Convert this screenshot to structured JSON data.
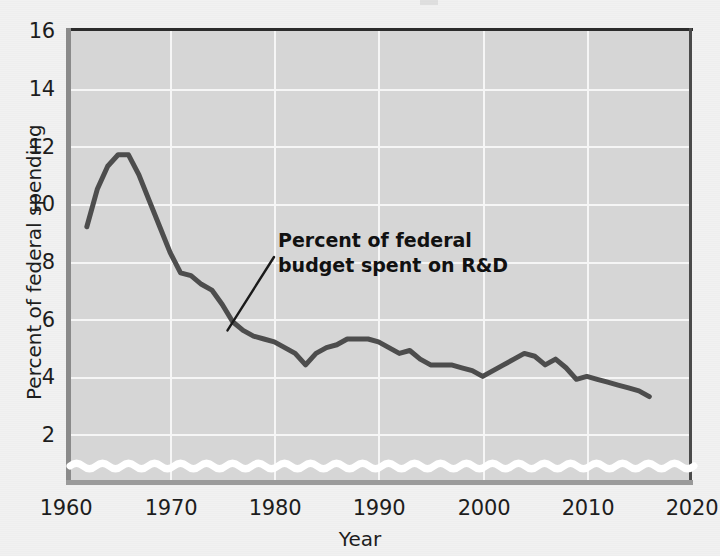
{
  "chart_data": {
    "type": "line",
    "title": "",
    "xlabel": "Year",
    "ylabel": "Percent of federal spending",
    "xlim": [
      1960,
      2020
    ],
    "ylim": [
      1.2,
      16
    ],
    "yticks": [
      2,
      4,
      6,
      8,
      10,
      12,
      14,
      16
    ],
    "xticks": [
      1960,
      1970,
      1980,
      1990,
      2000,
      2010,
      2020
    ],
    "grid": true,
    "legend": "none",
    "axis_break": true,
    "axis_break_note": "white wavy line near bottom indicating broken y-axis",
    "line_color": "#4d4d4d",
    "plot_background": "#d6d6d6",
    "page_background": "#f1f1f1",
    "gridline_color": "#f6f6f6",
    "annotations": [
      {
        "text_line1": "Percent of federal",
        "text_line2": "budget spent on R&D",
        "points_to_x": 1975.5,
        "points_to_y": 5.6
      }
    ],
    "series": [
      {
        "name": "Percent of federal budget spent on R&D",
        "x": [
          1962,
          1963,
          1964,
          1965,
          1966,
          1967,
          1968,
          1969,
          1970,
          1971,
          1972,
          1973,
          1974,
          1975,
          1976,
          1977,
          1978,
          1979,
          1980,
          1981,
          1982,
          1983,
          1984,
          1985,
          1986,
          1987,
          1988,
          1989,
          1990,
          1991,
          1992,
          1993,
          1994,
          1995,
          1996,
          1997,
          1998,
          1999,
          2000,
          2001,
          2002,
          2003,
          2004,
          2005,
          2006,
          2007,
          2008,
          2009,
          2010,
          2011,
          2012,
          2013,
          2014,
          2015,
          2016
        ],
        "y": [
          9.2,
          10.5,
          11.3,
          11.7,
          11.7,
          11.0,
          10.1,
          9.2,
          8.3,
          7.6,
          7.5,
          7.2,
          7.0,
          6.5,
          5.9,
          5.6,
          5.4,
          5.3,
          5.2,
          5.0,
          4.8,
          4.4,
          4.8,
          5.0,
          5.1,
          5.3,
          5.3,
          5.3,
          5.2,
          5.0,
          4.8,
          4.9,
          4.6,
          4.4,
          4.4,
          4.4,
          4.3,
          4.2,
          4.0,
          4.2,
          4.4,
          4.6,
          4.8,
          4.7,
          4.4,
          4.6,
          4.3,
          3.9,
          4.0,
          3.9,
          3.8,
          3.7,
          3.6,
          3.5,
          3.3
        ],
        "color": "#4d4d4d",
        "linewidth": 5
      }
    ]
  },
  "axis": {
    "ytick_labels": [
      "2",
      "4",
      "6",
      "8",
      "10",
      "12",
      "14",
      "16"
    ],
    "xtick_labels": [
      "1960",
      "1970",
      "1980",
      "1990",
      "2000",
      "2010",
      "2020"
    ],
    "x_title": "Year",
    "y_title": "Percent of federal spending"
  },
  "annotation": {
    "line1": "Percent of federal",
    "line2": "budget spent on R&D"
  }
}
